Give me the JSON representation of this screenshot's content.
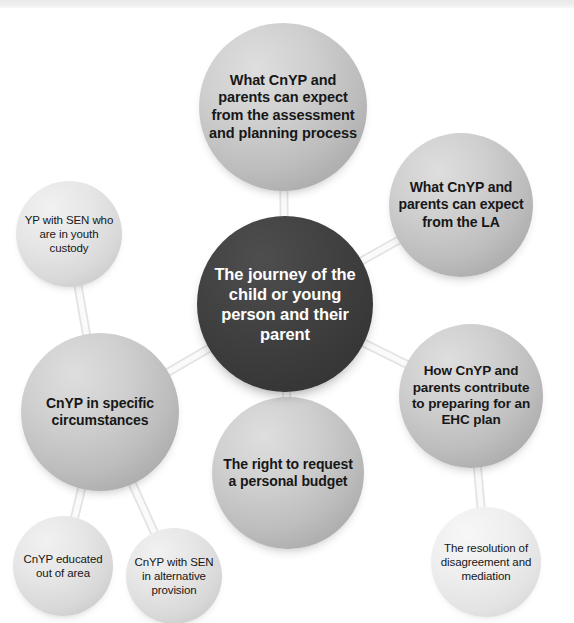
{
  "diagram": {
    "title": "The journey of the child or young person and their parent",
    "type": "mind-map",
    "center": {
      "id": "journey",
      "label": "The journey of the child or young person and their parent",
      "style": "dark",
      "cx": 285,
      "cy": 304,
      "r": 88,
      "font_size": 16.5,
      "weight": "bold"
    },
    "nodes": [
      {
        "id": "expect-assessment",
        "label": "What CnYP and parents can expect from the assessment and planning process",
        "style": "mid",
        "cx": 283,
        "cy": 107,
        "r": 84,
        "font_size": 14.5,
        "weight": "bold"
      },
      {
        "id": "expect-la",
        "label": "What CnYP and parents can expect from the LA",
        "style": "mid",
        "cx": 461,
        "cy": 205,
        "r": 72,
        "font_size": 14,
        "weight": "bold"
      },
      {
        "id": "contribute-ehc",
        "label": "How CnYP and parents contribute to preparing for an EHC plan",
        "style": "mid",
        "cx": 471,
        "cy": 396,
        "r": 72,
        "font_size": 13.5,
        "weight": "bold"
      },
      {
        "id": "resolution",
        "label": "The resolution of disagreement and mediation",
        "style": "pale",
        "cx": 486,
        "cy": 562,
        "r": 55,
        "font_size": 11.5,
        "weight": "normal"
      },
      {
        "id": "personal-budget",
        "label": "The right to request a personal budget",
        "style": "mid",
        "cx": 288,
        "cy": 473,
        "r": 76,
        "font_size": 14,
        "weight": "bold"
      },
      {
        "id": "specific-circumstances",
        "label": "CnYP in specific circumstances",
        "style": "mid",
        "cx": 100,
        "cy": 412,
        "r": 79,
        "font_size": 14,
        "weight": "bold"
      },
      {
        "id": "youth-custody",
        "label": "YP with SEN who are in youth custody",
        "style": "light",
        "cx": 69,
        "cy": 234,
        "r": 53,
        "font_size": 11.5,
        "weight": "normal"
      },
      {
        "id": "educated-out-of-area",
        "label": "CnYP educated out of area",
        "style": "light",
        "cx": 63,
        "cy": 566,
        "r": 50,
        "font_size": 11.5,
        "weight": "normal"
      },
      {
        "id": "alternative-provision",
        "label": "CnYP with SEN in alternative provision",
        "style": "light",
        "cx": 174,
        "cy": 576,
        "r": 48,
        "font_size": 11.5,
        "weight": "normal"
      }
    ],
    "links": [
      {
        "from": "journey",
        "to": "expect-assessment"
      },
      {
        "from": "journey",
        "to": "expect-la"
      },
      {
        "from": "journey",
        "to": "contribute-ehc"
      },
      {
        "from": "contribute-ehc",
        "to": "resolution"
      },
      {
        "from": "journey",
        "to": "personal-budget"
      },
      {
        "from": "journey",
        "to": "specific-circumstances"
      },
      {
        "from": "specific-circumstances",
        "to": "youth-custody"
      },
      {
        "from": "specific-circumstances",
        "to": "educated-out-of-area"
      },
      {
        "from": "specific-circumstances",
        "to": "alternative-provision"
      }
    ],
    "colors": {
      "background": "#ffffff",
      "center_fill": "#3a3a3a",
      "center_text": "#ffffff",
      "node_fill_mid": "#c4c4c4",
      "node_fill_light": "#e2e2e2",
      "node_fill_pale": "#ededed",
      "node_text": "#171717",
      "connector": "#e3e3e3",
      "top_band": "#ebebec"
    }
  }
}
